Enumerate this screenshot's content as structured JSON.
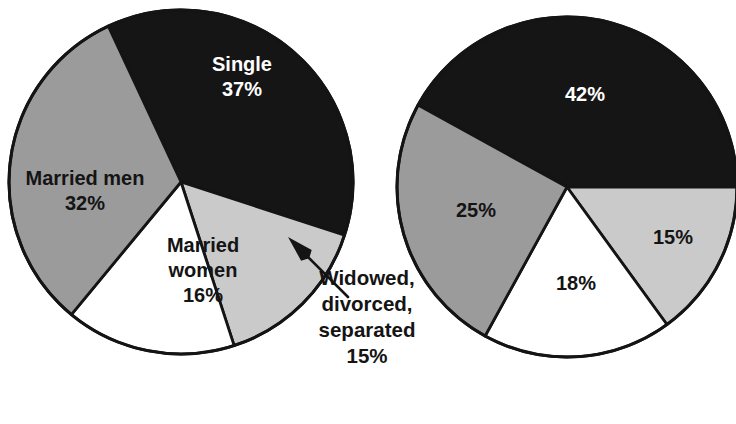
{
  "figure": {
    "background_color": "#ffffff",
    "outline_color": "#141414",
    "colors": {
      "black": "#151515",
      "medium_gray": "#9b9b9b",
      "light_gray": "#cacaca",
      "white": "#ffffff",
      "text_dark": "#141414",
      "text_light": "#ffffff"
    }
  },
  "chart_data": [
    {
      "type": "pie",
      "name": "left-pie-chart",
      "title": "",
      "center": [
        181,
        182
      ],
      "radius": 172,
      "start_angle_deg": -18,
      "labels": [
        "Single",
        "Widowed, divorced, separated",
        "Married women",
        "Married men"
      ],
      "values": [
        37,
        15,
        16,
        32
      ],
      "value_labels": [
        "37%",
        "15%",
        "16%",
        "32%"
      ],
      "slice_colors": [
        "#151515",
        "#cacaca",
        "#ffffff",
        "#9b9b9b"
      ],
      "slices": [
        {
          "key": "single",
          "label": "Single",
          "value": 37,
          "value_label": "37%",
          "color": "#151515",
          "label_color": "#ffffff",
          "label_placement": "inside",
          "label_lines": [
            "Single",
            "37%"
          ],
          "label_x": 242,
          "label_y": 78,
          "start_deg": -18,
          "end_deg": 115.2
        },
        {
          "key": "widowed-divorced-separated",
          "label": "Widowed, divorced, separated",
          "value": 15,
          "value_label": "15%",
          "color": "#cacaca",
          "label_color": "#141414",
          "label_placement": "callout",
          "label_lines": [
            "Widowed,",
            "divorced,",
            "separated",
            "15%"
          ],
          "label_x": 367,
          "label_y": 324,
          "start_deg": -18,
          "end_deg": -72
        },
        {
          "key": "married-women",
          "label": "Married women",
          "value": 16,
          "value_label": "16%",
          "color": "#ffffff",
          "label_color": "#141414",
          "label_placement": "inside",
          "label_lines": [
            "Married",
            "women",
            "16%"
          ],
          "label_x": 203,
          "label_y": 272,
          "start_deg": -72,
          "end_deg": -129.6
        },
        {
          "key": "married-men",
          "label": "Married men",
          "value": 32,
          "value_label": "32%",
          "color": "#9b9b9b",
          "label_color": "#141414",
          "label_placement": "inside",
          "label_lines": [
            "Married men",
            "32%"
          ],
          "label_x": 85,
          "label_y": 192,
          "start_deg": -129.6,
          "end_deg": -245.0
        }
      ],
      "annotation": {
        "key": "widowed-callout",
        "arrow_tip": [
          288,
          237
        ],
        "arrow_tail": [
          348,
          297
        ],
        "text_lines": [
          "Widowed,",
          "divorced,",
          "separated",
          "15%"
        ]
      }
    },
    {
      "type": "pie",
      "name": "right-pie-chart",
      "title": "",
      "center": [
        567,
        187
      ],
      "radius": 170,
      "start_angle_deg": 0,
      "labels": [
        "42%",
        "15%",
        "18%",
        "25%"
      ],
      "values": [
        42,
        15,
        18,
        25
      ],
      "value_labels": [
        "42%",
        "15%",
        "18%",
        "25%"
      ],
      "slice_colors": [
        "#151515",
        "#cacaca",
        "#ffffff",
        "#9b9b9b"
      ],
      "slices": [
        {
          "key": "segment-42",
          "label": "42%",
          "value": 42,
          "value_label": "42%",
          "color": "#151515",
          "label_color": "#ffffff",
          "label_placement": "inside",
          "label_lines": [
            "42%"
          ],
          "label_x": 585,
          "label_y": 96,
          "start_deg": 0,
          "end_deg": 151.2
        },
        {
          "key": "segment-15",
          "label": "15%",
          "value": 15,
          "value_label": "15%",
          "color": "#cacaca",
          "label_color": "#141414",
          "label_placement": "inside",
          "label_lines": [
            "15%"
          ],
          "label_x": 673,
          "label_y": 239,
          "start_deg": 0,
          "end_deg": -54
        },
        {
          "key": "segment-18",
          "label": "18%",
          "value": 18,
          "value_label": "18%",
          "color": "#ffffff",
          "label_color": "#141414",
          "label_placement": "inside",
          "label_lines": [
            "18%"
          ],
          "label_x": 576,
          "label_y": 285,
          "start_deg": -54,
          "end_deg": -118.8
        },
        {
          "key": "segment-25",
          "label": "25%",
          "value": 25,
          "value_label": "25%",
          "color": "#9b9b9b",
          "label_color": "#141414",
          "label_placement": "inside",
          "label_lines": [
            "25%"
          ],
          "label_x": 476,
          "label_y": 212,
          "start_deg": -118.8,
          "end_deg": -208.8
        }
      ]
    }
  ]
}
